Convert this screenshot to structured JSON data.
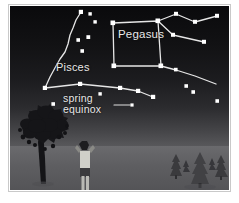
{
  "sky": {
    "labels": {
      "pegasus": "Pegasus",
      "pisces": "Pisces",
      "spring_equinox_line1": "spring",
      "spring_equinox_line2": "equinox"
    },
    "colors": {
      "star": "#ffffff",
      "constellation_line": "#e6e6e6",
      "label_text": "#e8e8e8",
      "sky_zenith": "#0a0a0c",
      "sky_horizon": "#5a5a5d",
      "ground": "#5e5e61",
      "tree_silhouette": "#17171a",
      "pine_silhouette": "#3c3c3f"
    },
    "constellations": [
      {
        "name": "Pegasus",
        "feature": "Great Square of Pegasus",
        "stars": [
          {
            "x": 103,
            "y": 17,
            "label": "Scheat"
          },
          {
            "x": 148,
            "y": 15,
            "label": "Alpheratz"
          },
          {
            "x": 151,
            "y": 60,
            "label": "Algenib"
          },
          {
            "x": 104,
            "y": 60,
            "label": "Markab"
          }
        ]
      },
      {
        "name": "Pisces",
        "feature": "Circlet and western fish chain",
        "stars": [
          {
            "x": 71,
            "y": 6,
            "label": ""
          },
          {
            "x": 63,
            "y": 22,
            "label": ""
          },
          {
            "x": 58,
            "y": 38,
            "label": ""
          },
          {
            "x": 46,
            "y": 60,
            "label": ""
          },
          {
            "x": 35,
            "y": 82,
            "label": ""
          },
          {
            "x": 70,
            "y": 78,
            "label": ""
          },
          {
            "x": 110,
            "y": 82,
            "label": ""
          },
          {
            "x": 128,
            "y": 85,
            "label": ""
          },
          {
            "x": 143,
            "y": 91,
            "label": ""
          }
        ]
      },
      {
        "name": "Andromeda",
        "feature": "Star chain east of the Great Square",
        "stars": [
          {
            "x": 148,
            "y": 15,
            "label": ""
          },
          {
            "x": 166,
            "y": 8,
            "label": ""
          },
          {
            "x": 185,
            "y": 16,
            "label": ""
          },
          {
            "x": 207,
            "y": 10,
            "label": ""
          },
          {
            "x": 163,
            "y": 29,
            "label": ""
          },
          {
            "x": 194,
            "y": 36,
            "label": ""
          }
        ]
      }
    ],
    "field_stars": [
      {
        "x": 80,
        "y": 8
      },
      {
        "x": 85,
        "y": 16
      },
      {
        "x": 78,
        "y": 31
      },
      {
        "x": 68,
        "y": 34
      },
      {
        "x": 72,
        "y": 45
      },
      {
        "x": 90,
        "y": 88
      },
      {
        "x": 176,
        "y": 80
      },
      {
        "x": 183,
        "y": 86
      },
      {
        "x": 207,
        "y": 95
      },
      {
        "x": 43,
        "y": 98
      },
      {
        "x": 122,
        "y": 100
      }
    ],
    "annotation": {
      "name": "spring equinox",
      "pointer_from": {
        "x": 104,
        "y": 99
      },
      "pointer_to": {
        "x": 122,
        "y": 99
      },
      "marker": {
        "x": 122,
        "y": 99
      }
    }
  },
  "landscape": {
    "elements": [
      {
        "name": "deciduous-tree",
        "x": 6,
        "y": 96,
        "width": 54,
        "height": 82
      },
      {
        "name": "observer-person",
        "x": 68,
        "y": 136,
        "width": 18,
        "height": 54
      },
      {
        "name": "pine-tree-cluster",
        "x": 160,
        "y": 140,
        "width": 68,
        "height": 42
      }
    ],
    "observer": {
      "pose": "standing, arms raised holding binoculars",
      "shirt_color": "#cfcfc9",
      "shorts_color": "#3a3a3d",
      "skin_color": "#8a8a86"
    }
  }
}
